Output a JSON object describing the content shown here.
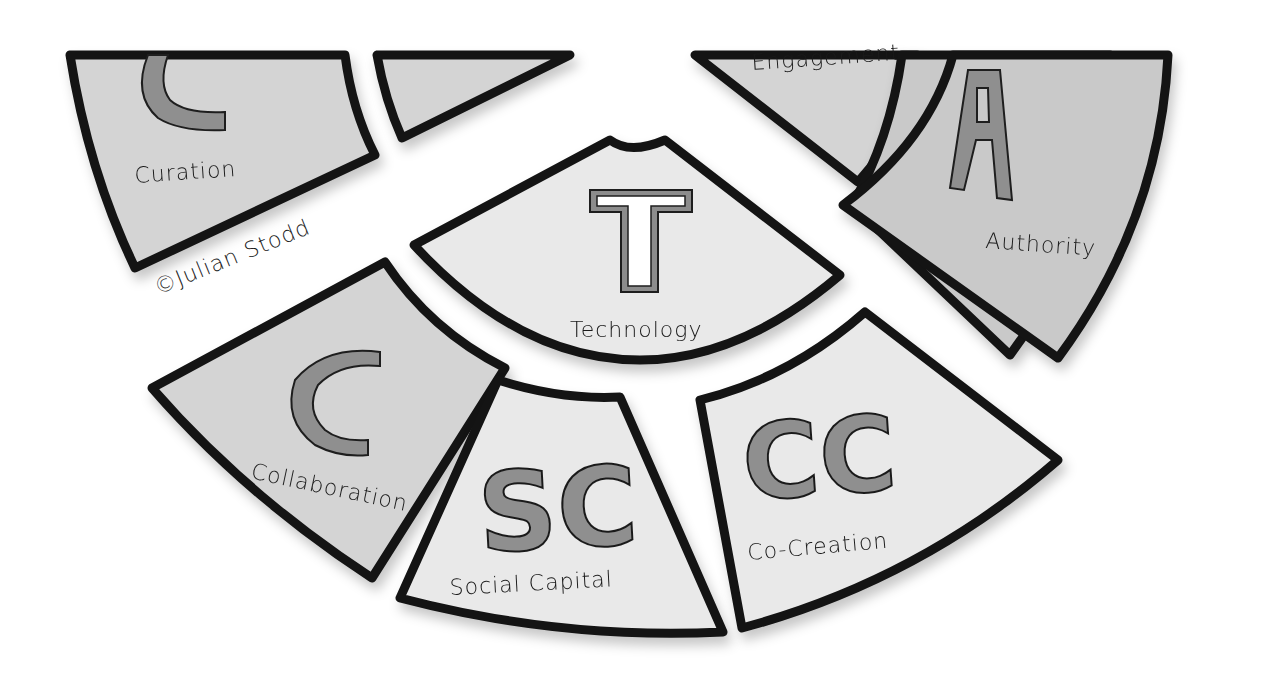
{
  "diagram": {
    "type": "segmented-arc-wheel",
    "credit": "©Julian Stodd",
    "segments": [
      {
        "id": "curation",
        "letter": "C",
        "label": "Curation",
        "shade": "mid"
      },
      {
        "id": "top-left-partial",
        "letter": "",
        "label": "",
        "shade": "mid"
      },
      {
        "id": "engagement",
        "letter": "",
        "label": "Engagement",
        "shade": "mid"
      },
      {
        "id": "authority",
        "letter": "A",
        "label": "Authority",
        "shade": "dark"
      },
      {
        "id": "technology",
        "letter": "T",
        "label": "Technology",
        "shade": "light"
      },
      {
        "id": "collaboration",
        "letter": "C",
        "label": "Collaboration",
        "shade": "mid"
      },
      {
        "id": "social-capital",
        "letter": "SC",
        "label": "Social Capital",
        "shade": "light"
      },
      {
        "id": "co-creation",
        "letter": "CC",
        "label": "Co-Creation",
        "shade": "light"
      }
    ]
  },
  "colors": {
    "outline": "#141414",
    "fill_dark": "#c9c9c9",
    "fill_mid": "#d4d4d4",
    "fill_light": "#e9e9e9",
    "letter_fill": "#8f8f8f"
  }
}
